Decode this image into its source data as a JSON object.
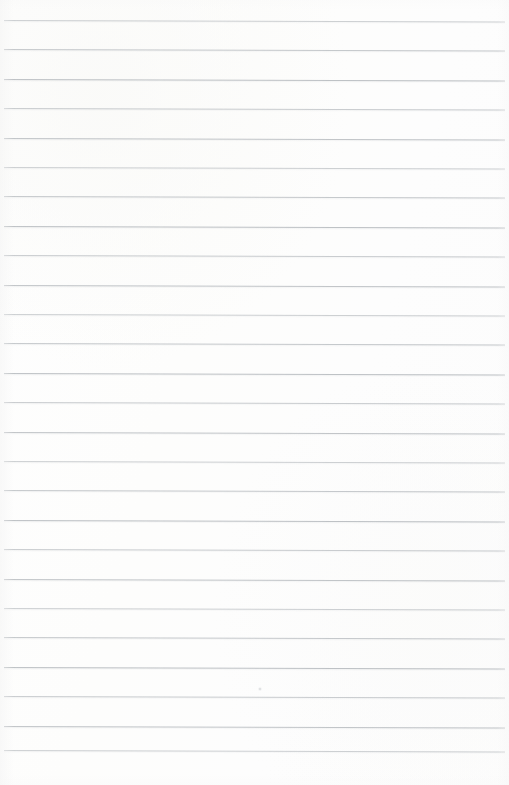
{
  "document": {
    "kind": "scanned-lined-paper",
    "title": "Blank ruled notepad page",
    "width": 509,
    "height": 785,
    "page_text": "",
    "handwriting": "",
    "printed_text": "",
    "has_margin_rule": false,
    "has_holes": false,
    "has_header": false,
    "has_page_number": false
  },
  "colors": {
    "paper_background": "#fdfdfd",
    "rule_line": "#b9bdc1",
    "page_edge": "#f6f6f6",
    "speck": "#b0b4b8"
  },
  "ruling": {
    "line_count": 26,
    "first_line_y": 20,
    "line_spacing": 29.4,
    "line_start_x": 4,
    "line_end_x": 505,
    "line_thickness": 1,
    "skew_degrees": 0.16,
    "bottom_margin_start_y": 755,
    "line_y_positions": [
      20,
      49,
      79,
      108,
      138,
      167,
      196,
      226,
      255,
      285,
      314,
      343,
      373,
      402,
      432,
      461,
      490,
      520,
      549,
      579,
      608,
      637,
      667,
      696,
      726,
      750
    ]
  },
  "artifacts": {
    "speck": {
      "x": 258,
      "y": 687
    }
  }
}
